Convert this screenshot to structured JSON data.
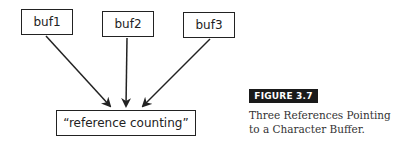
{
  "diagram": {
    "nodes": [
      {
        "id": "buf1",
        "label": "buf1"
      },
      {
        "id": "buf2",
        "label": "buf2"
      },
      {
        "id": "buf3",
        "label": "buf3"
      },
      {
        "id": "target",
        "label": "“reference counting”"
      }
    ],
    "edges": [
      {
        "from": "buf1",
        "to": "target"
      },
      {
        "from": "buf2",
        "to": "target"
      },
      {
        "from": "buf3",
        "to": "target"
      }
    ]
  },
  "figure": {
    "label": "FIGURE 3.7",
    "caption_line1": "Three References Pointing",
    "caption_line2": "to a Character Buffer."
  }
}
